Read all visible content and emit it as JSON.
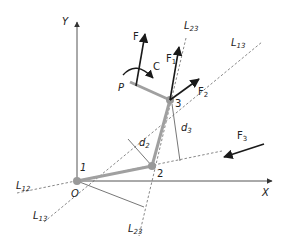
{
  "diagram": {
    "type": "statics-free-body-diagram",
    "axes": {
      "x_label": "X",
      "y_label": "Y",
      "origin_label": "O"
    },
    "points": [
      {
        "id": "1",
        "label": "1",
        "x": 77,
        "y": 181
      },
      {
        "id": "2",
        "label": "2",
        "x": 152,
        "y": 166
      },
      {
        "id": "3",
        "label": "3",
        "x": 170,
        "y": 100
      },
      {
        "id": "P",
        "label": "P",
        "x": 131,
        "y": 84
      }
    ],
    "forces": [
      {
        "id": "F",
        "label": "F",
        "sub": ""
      },
      {
        "id": "F1",
        "label": "F",
        "sub": "1"
      },
      {
        "id": "F2",
        "label": "F",
        "sub": "2"
      },
      {
        "id": "F3",
        "label": "F",
        "sub": "3"
      }
    ],
    "couple": {
      "label": "C"
    },
    "lines": [
      {
        "id": "L12",
        "label": "L",
        "sub": "12"
      },
      {
        "id": "L13_top",
        "label": "L",
        "sub": "13"
      },
      {
        "id": "L13_bottom",
        "label": "L",
        "sub": "13"
      },
      {
        "id": "L23_top",
        "label": "L",
        "sub": "23"
      },
      {
        "id": "L23_bottom",
        "label": "L",
        "sub": "23"
      }
    ],
    "distances": [
      {
        "id": "d2",
        "label": "d",
        "sub": "2"
      },
      {
        "id": "d3",
        "label": "d",
        "sub": "3"
      }
    ],
    "colors": {
      "axis": "#555555",
      "member": "#a0a0a0",
      "dashed": "#888888",
      "arrow": "#1a1a1a",
      "text": "#222222"
    }
  }
}
